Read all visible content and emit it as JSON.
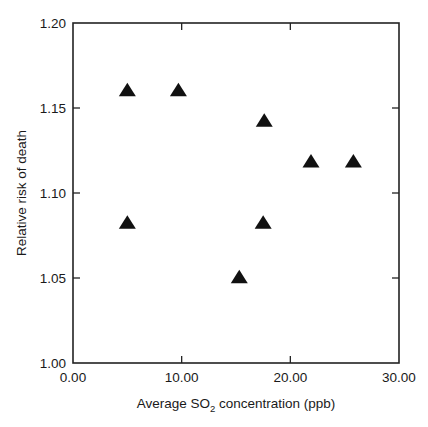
{
  "chart_data": {
    "type": "scatter",
    "title": "",
    "xlabel": "Average SO2 concentration (ppb)",
    "xlabel_prefix": "Average SO",
    "xlabel_subscript": "2",
    "xlabel_suffix": " concentration (ppb)",
    "ylabel": "Relative risk of death",
    "xlim": [
      0,
      30
    ],
    "ylim": [
      1.0,
      1.2
    ],
    "xticks": [
      0,
      10,
      20,
      30
    ],
    "yticks": [
      1.0,
      1.05,
      1.1,
      1.15,
      1.2
    ],
    "xtick_labels": [
      "0.00",
      "10.00",
      "20.00",
      "30.00"
    ],
    "ytick_labels": [
      "1.00",
      "1.05",
      "1.10",
      "1.15",
      "1.20"
    ],
    "grid": false,
    "legend": false,
    "marker": "triangle",
    "marker_color": "#111111",
    "x": [
      5.0,
      9.7,
      5.0,
      15.3,
      17.5,
      17.6,
      21.9,
      25.8
    ],
    "y": [
      1.16,
      1.16,
      1.082,
      1.05,
      1.082,
      1.142,
      1.118,
      1.118
    ],
    "points": [
      {
        "x": 5.0,
        "y": 1.16
      },
      {
        "x": 9.7,
        "y": 1.16
      },
      {
        "x": 5.0,
        "y": 1.082
      },
      {
        "x": 15.3,
        "y": 1.05
      },
      {
        "x": 17.5,
        "y": 1.082
      },
      {
        "x": 17.6,
        "y": 1.142
      },
      {
        "x": 21.9,
        "y": 1.118
      },
      {
        "x": 25.8,
        "y": 1.118
      }
    ]
  }
}
